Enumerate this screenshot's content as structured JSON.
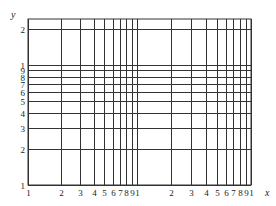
{
  "figure": {
    "title": "",
    "type": "log-log graph paper",
    "x_axis": {
      "label": "x",
      "scale": "log",
      "decades": 2,
      "tick_labels": [
        "1",
        "2",
        "3",
        "4",
        "5",
        "6",
        "7",
        "8",
        "9",
        "1",
        "2",
        "3",
        "4",
        "5",
        "6",
        "7",
        "8",
        "9",
        "1"
      ],
      "tick_values": [
        1,
        2,
        3,
        4,
        5,
        6,
        7,
        8,
        9,
        10,
        20,
        30,
        40,
        50,
        60,
        70,
        80,
        90,
        100
      ]
    },
    "y_axis": {
      "label": "y",
      "scale": "log",
      "decades": 1.3,
      "tick_labels": [
        "1",
        "2",
        "3",
        "4",
        "5",
        "6",
        "7",
        "8",
        "9",
        "1",
        "2"
      ],
      "tick_values": [
        1,
        2,
        3,
        4,
        5,
        6,
        7,
        8,
        9,
        10,
        20
      ]
    },
    "grid": {
      "left": 28,
      "right": 251,
      "top": 19,
      "bottom": 185,
      "x_decade_px": [
        109,
        114
      ],
      "y_decade_px": 120,
      "line_color": "#333333"
    }
  },
  "chart_data": {
    "type": "grid",
    "title": "",
    "xlabel": "x",
    "ylabel": "y",
    "xscale": "log",
    "yscale": "log",
    "xlim": [
      1,
      100
    ],
    "ylim": [
      1,
      20
    ],
    "x_ticks": [
      1,
      2,
      3,
      4,
      5,
      6,
      7,
      8,
      9,
      10,
      20,
      30,
      40,
      50,
      60,
      70,
      80,
      90,
      100
    ],
    "x_tick_labels": [
      "1",
      "2",
      "3",
      "4",
      "5",
      "6",
      "7",
      "8",
      "9",
      "1",
      "2",
      "3",
      "4",
      "5",
      "6",
      "7",
      "8",
      "9",
      "1"
    ],
    "y_ticks": [
      1,
      2,
      3,
      4,
      5,
      6,
      7,
      8,
      9,
      10,
      20
    ],
    "y_tick_labels": [
      "1",
      "2",
      "3",
      "4",
      "5",
      "6",
      "7",
      "8",
      "9",
      "1",
      "2"
    ],
    "grid": true,
    "series": []
  }
}
